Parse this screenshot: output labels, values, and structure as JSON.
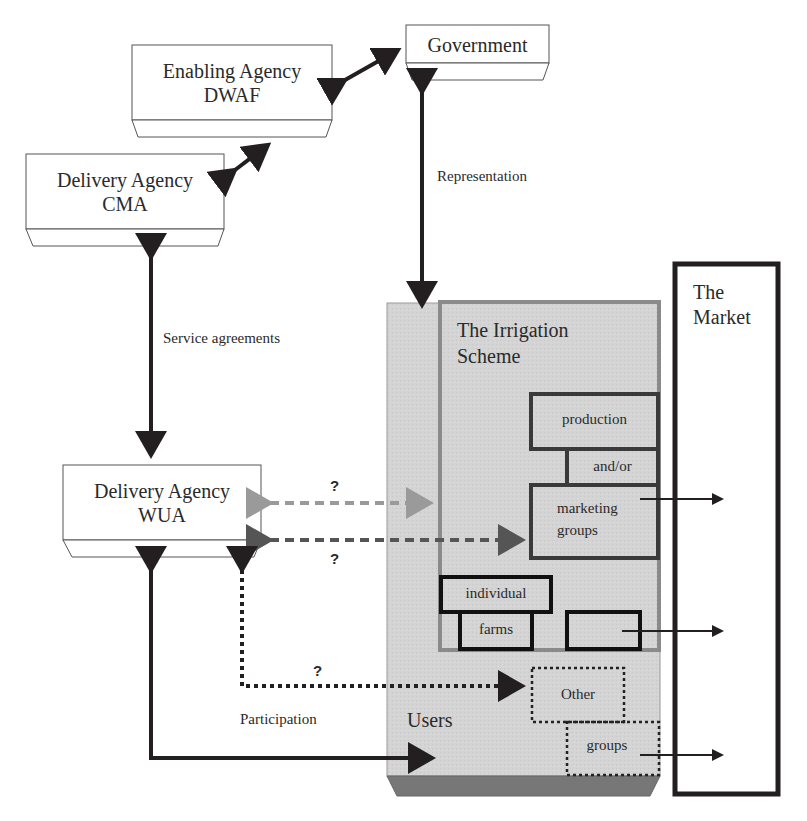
{
  "nodes": {
    "government": {
      "label": "Government"
    },
    "enabling_agency": {
      "line1": "Enabling Agency",
      "line2": "DWAF"
    },
    "cma": {
      "line1": "Delivery Agency",
      "line2": "CMA"
    },
    "wua": {
      "line1": "Delivery Agency",
      "line2": "WUA"
    },
    "irrigation_scheme": {
      "line1": "The Irrigation",
      "line2": "Scheme"
    },
    "market": {
      "line1": "The",
      "line2": "Market"
    },
    "users": {
      "label": "Users"
    },
    "production": {
      "label": "production"
    },
    "and_or": {
      "label": "and/or"
    },
    "marketing_groups": {
      "line1": "marketing",
      "line2": "groups"
    },
    "individual": {
      "label": "individual"
    },
    "farms": {
      "label": "farms"
    },
    "other": {
      "label": "Other"
    },
    "groups": {
      "label": "groups"
    }
  },
  "edge_labels": {
    "representation": "Representation",
    "service_agreements": "Service agreements",
    "participation": "Participation",
    "q1": "?",
    "q2": "?",
    "q3": "?"
  },
  "colors": {
    "users_fill": "#d6d6d6",
    "scheme_border": "#8a8a8a",
    "dark": "#231f20",
    "light_dash": "#9a9a9a",
    "mid_dash": "#555555"
  }
}
